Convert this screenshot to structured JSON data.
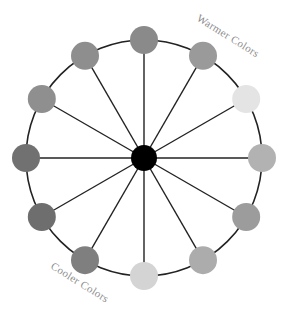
{
  "diagram": {
    "type": "color-wheel",
    "center": {
      "x": 144,
      "y": 158,
      "r": 13,
      "color": "#000000"
    },
    "ring": {
      "r": 118,
      "stroke": "#222222"
    },
    "node_radius": 14,
    "spoke_color": "#222222",
    "nodes": [
      {
        "angle": 0,
        "color": "#8a8a8a"
      },
      {
        "angle": 30,
        "color": "#9a9a9a"
      },
      {
        "angle": 60,
        "color": "#e4e4e4"
      },
      {
        "angle": 90,
        "color": "#b2b2b2"
      },
      {
        "angle": 120,
        "color": "#9c9c9c"
      },
      {
        "angle": 150,
        "color": "#acacac"
      },
      {
        "angle": 180,
        "color": "#d4d4d4"
      },
      {
        "angle": 210,
        "color": "#7f7f7f"
      },
      {
        "angle": 240,
        "color": "#6e6e6e"
      },
      {
        "angle": 270,
        "color": "#717171"
      },
      {
        "angle": 300,
        "color": "#8f8f8f"
      },
      {
        "angle": 330,
        "color": "#8e8e8e"
      }
    ],
    "labels": {
      "warmer": "Warmer Colors",
      "cooler": "Cooler Colors"
    }
  }
}
